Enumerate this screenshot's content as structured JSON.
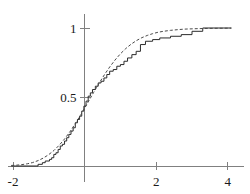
{
  "chart_data": {
    "type": "line",
    "title": "",
    "subtitle": "",
    "xlabel": "",
    "ylabel": "",
    "xlim": [
      -2.05,
      4.1
    ],
    "ylim": [
      -0.03,
      1.08
    ],
    "grid": false,
    "legend": null,
    "x_ticks": [
      {
        "value": -2,
        "label": "-2"
      },
      {
        "value": 2,
        "label": "2"
      },
      {
        "value": 4,
        "label": "4"
      }
    ],
    "y_ticks": [
      {
        "value": 0.5,
        "label": "0.5"
      },
      {
        "value": 1,
        "label": "1"
      }
    ],
    "axis_color": "#808080",
    "series": [
      {
        "name": "empirical-cdf",
        "style": "step",
        "color": "#2b2b2b",
        "dash": "none",
        "width": 1,
        "points": [
          [
            -2.05,
            0.0
          ],
          [
            -1.3,
            0.0
          ],
          [
            -1.3,
            0.012
          ],
          [
            -1.18,
            0.012
          ],
          [
            -1.18,
            0.024
          ],
          [
            -1.1,
            0.024
          ],
          [
            -1.1,
            0.036
          ],
          [
            -0.98,
            0.036
          ],
          [
            -0.98,
            0.048
          ],
          [
            -0.92,
            0.048
          ],
          [
            -0.92,
            0.06
          ],
          [
            -0.86,
            0.06
          ],
          [
            -0.86,
            0.084
          ],
          [
            -0.8,
            0.084
          ],
          [
            -0.8,
            0.096
          ],
          [
            -0.74,
            0.096
          ],
          [
            -0.74,
            0.12
          ],
          [
            -0.68,
            0.12
          ],
          [
            -0.68,
            0.145
          ],
          [
            -0.62,
            0.145
          ],
          [
            -0.62,
            0.157
          ],
          [
            -0.56,
            0.157
          ],
          [
            -0.56,
            0.181
          ],
          [
            -0.5,
            0.181
          ],
          [
            -0.5,
            0.205
          ],
          [
            -0.44,
            0.205
          ],
          [
            -0.44,
            0.229
          ],
          [
            -0.38,
            0.229
          ],
          [
            -0.38,
            0.253
          ],
          [
            -0.32,
            0.253
          ],
          [
            -0.32,
            0.277
          ],
          [
            -0.26,
            0.277
          ],
          [
            -0.26,
            0.313
          ],
          [
            -0.2,
            0.313
          ],
          [
            -0.2,
            0.337
          ],
          [
            -0.14,
            0.337
          ],
          [
            -0.14,
            0.361
          ],
          [
            -0.08,
            0.361
          ],
          [
            -0.08,
            0.398
          ],
          [
            -0.02,
            0.398
          ],
          [
            -0.02,
            0.434
          ],
          [
            0.04,
            0.434
          ],
          [
            0.04,
            0.47
          ],
          [
            0.1,
            0.47
          ],
          [
            0.1,
            0.506
          ],
          [
            0.16,
            0.506
          ],
          [
            0.16,
            0.53
          ],
          [
            0.22,
            0.53
          ],
          [
            0.22,
            0.554
          ],
          [
            0.3,
            0.554
          ],
          [
            0.3,
            0.578
          ],
          [
            0.38,
            0.578
          ],
          [
            0.38,
            0.602
          ],
          [
            0.46,
            0.602
          ],
          [
            0.46,
            0.614
          ],
          [
            0.54,
            0.614
          ],
          [
            0.54,
            0.638
          ],
          [
            0.62,
            0.638
          ],
          [
            0.62,
            0.663
          ],
          [
            0.7,
            0.663
          ],
          [
            0.7,
            0.687
          ],
          [
            0.8,
            0.687
          ],
          [
            0.8,
            0.699
          ],
          [
            0.9,
            0.699
          ],
          [
            0.9,
            0.723
          ],
          [
            1.0,
            0.723
          ],
          [
            1.0,
            0.735
          ],
          [
            1.1,
            0.735
          ],
          [
            1.1,
            0.759
          ],
          [
            1.2,
            0.759
          ],
          [
            1.2,
            0.783
          ],
          [
            1.32,
            0.783
          ],
          [
            1.32,
            0.807
          ],
          [
            1.44,
            0.807
          ],
          [
            1.44,
            0.831
          ],
          [
            1.56,
            0.831
          ],
          [
            1.56,
            0.88
          ],
          [
            1.7,
            0.88
          ],
          [
            1.7,
            0.904
          ],
          [
            1.9,
            0.904
          ],
          [
            1.9,
            0.916
          ],
          [
            2.1,
            0.916
          ],
          [
            2.1,
            0.928
          ],
          [
            2.4,
            0.928
          ],
          [
            2.4,
            0.94
          ],
          [
            2.7,
            0.94
          ],
          [
            2.7,
            0.952
          ],
          [
            3.0,
            0.952
          ],
          [
            3.0,
            0.976
          ],
          [
            3.3,
            0.976
          ],
          [
            3.3,
            1.0
          ],
          [
            4.1,
            1.0
          ]
        ]
      },
      {
        "name": "theoretical-cdf",
        "style": "smooth",
        "color": "#4a4a4a",
        "dash": "3,2",
        "width": 1,
        "points": [
          [
            -2.05,
            0.004
          ],
          [
            -1.9,
            0.006
          ],
          [
            -1.75,
            0.01
          ],
          [
            -1.6,
            0.016
          ],
          [
            -1.45,
            0.025
          ],
          [
            -1.3,
            0.039
          ],
          [
            -1.15,
            0.058
          ],
          [
            -1.0,
            0.083
          ],
          [
            -0.85,
            0.114
          ],
          [
            -0.7,
            0.153
          ],
          [
            -0.55,
            0.199
          ],
          [
            -0.4,
            0.252
          ],
          [
            -0.25,
            0.311
          ],
          [
            -0.1,
            0.374
          ],
          [
            0.0,
            0.419
          ],
          [
            0.1,
            0.464
          ],
          [
            0.25,
            0.532
          ],
          [
            0.4,
            0.598
          ],
          [
            0.55,
            0.66
          ],
          [
            0.7,
            0.717
          ],
          [
            0.85,
            0.768
          ],
          [
            1.0,
            0.813
          ],
          [
            1.15,
            0.851
          ],
          [
            1.3,
            0.883
          ],
          [
            1.45,
            0.909
          ],
          [
            1.6,
            0.93
          ],
          [
            1.75,
            0.946
          ],
          [
            1.9,
            0.959
          ],
          [
            2.05,
            0.969
          ],
          [
            2.2,
            0.976
          ],
          [
            2.4,
            0.983
          ],
          [
            2.6,
            0.988
          ],
          [
            2.8,
            0.992
          ],
          [
            3.0,
            0.994
          ],
          [
            3.25,
            0.996
          ],
          [
            3.5,
            0.997
          ],
          [
            3.75,
            0.998
          ],
          [
            4.1,
            0.999
          ]
        ]
      }
    ]
  }
}
